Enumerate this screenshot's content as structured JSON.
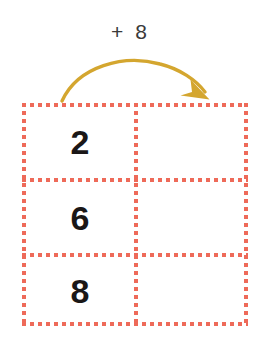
{
  "canvas": {
    "width": 261,
    "height": 344,
    "background": "#ffffff"
  },
  "caption": {
    "text": "+ 8",
    "operator": "+",
    "operand": "8",
    "color": "#3a3a3a"
  },
  "arrow": {
    "name": "curved-arrow",
    "color": "#d4a62f",
    "direction": "left-to-right-arc",
    "points_from": "input-column",
    "points_to": "output-column"
  },
  "table": {
    "columns": 2,
    "rows": 3,
    "border_color": "#ee6a59",
    "border_style": "dotted",
    "cells": [
      [
        {
          "value": "2",
          "empty": false
        },
        {
          "value": "",
          "empty": true
        }
      ],
      [
        {
          "value": "6",
          "empty": false
        },
        {
          "value": "",
          "empty": true
        }
      ],
      [
        {
          "value": "8",
          "empty": false
        },
        {
          "value": "",
          "empty": true
        }
      ]
    ]
  }
}
